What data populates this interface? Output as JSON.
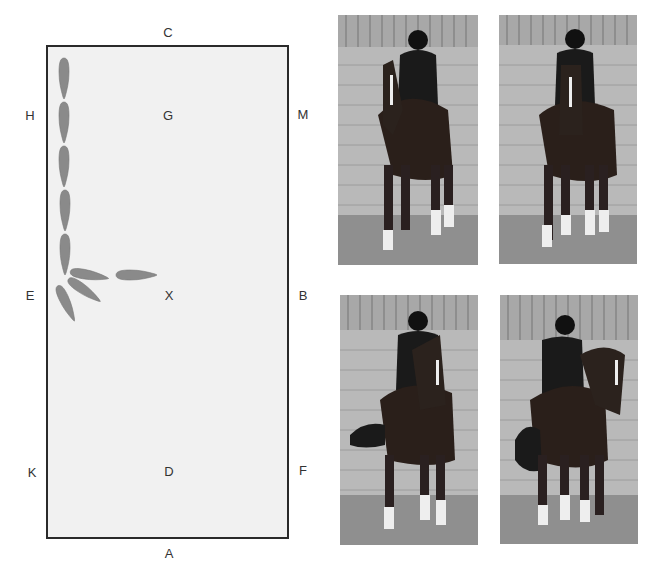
{
  "arena": {
    "markers": {
      "C": "C",
      "H": "H",
      "G": "G",
      "M": "M",
      "E": "E",
      "X": "X",
      "B": "B",
      "K": "K",
      "D": "D",
      "F": "F",
      "A": "A"
    },
    "colors": {
      "border": "#2a2a2a",
      "fill": "#f1f1f1",
      "horse_shapes": "#8a8a8a"
    },
    "path_description": "Horse travels straight down the long side from H to E, then turns across the arena toward X"
  },
  "photos": [
    {
      "label": "photo-1",
      "description": "Rider on dark horse in indoor school, walking towards camera, straight"
    },
    {
      "label": "photo-2",
      "description": "Rider on dark horse, straight, beginning turn"
    },
    {
      "label": "photo-3",
      "description": "Rider on dark horse, turning, horse bending"
    },
    {
      "label": "photo-4",
      "description": "Rider on dark horse, turning across arena, horse head to the right"
    }
  ]
}
